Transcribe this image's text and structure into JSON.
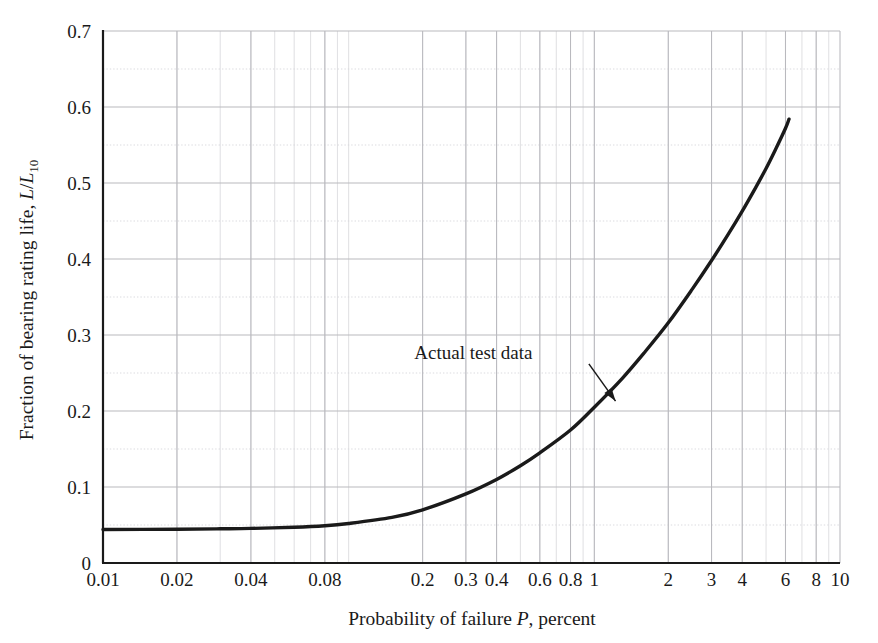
{
  "figure": {
    "background_color": "#ffffff",
    "frame_color": "#1a1a1a",
    "grid_major_color": "#b9b9be",
    "grid_minor_color": "#d7d7db",
    "curve_color": "#1a1a1a"
  },
  "chart_data": {
    "type": "line",
    "title": "",
    "xlabel_parts": {
      "before": "Probability of failure ",
      "italic": "P",
      "after": ", percent"
    },
    "xlabel": "Probability of failure P, percent",
    "ylabel_parts": {
      "before": "Fraction of bearing rating life, ",
      "italic_1": "L",
      "slash": "/",
      "italic_2": "L",
      "subscript": "10"
    },
    "ylabel": "Fraction of bearing rating life, L/L10",
    "xscale": "log",
    "yscale": "linear",
    "xlim": [
      0.01,
      10
    ],
    "ylim": [
      0,
      0.7
    ],
    "grid": true,
    "legend": "none",
    "xticks": [
      0.01,
      0.02,
      0.04,
      0.08,
      0.2,
      0.3,
      0.4,
      0.6,
      0.8,
      1,
      2,
      3,
      4,
      6,
      8,
      10
    ],
    "xtick_labels": [
      "0.01",
      "0.02",
      "0.04",
      "0.08",
      "0.2",
      "0.3",
      "0.4",
      "0.6",
      "0.8",
      "1",
      "2",
      "3",
      "4",
      "6",
      "8",
      "10"
    ],
    "yticks": [
      0,
      0.1,
      0.2,
      0.3,
      0.4,
      0.5,
      0.6,
      0.7
    ],
    "ytick_labels": [
      "0",
      "0.1",
      "0.2",
      "0.3",
      "0.4",
      "0.5",
      "0.6",
      "0.7"
    ],
    "y_minor_ticks": [
      0.05,
      0.15,
      0.25,
      0.35,
      0.45,
      0.55,
      0.65
    ],
    "series": [
      {
        "name": "Actual test data",
        "x": [
          0.01,
          0.02,
          0.03,
          0.04,
          0.06,
          0.08,
          0.1,
          0.15,
          0.2,
          0.3,
          0.4,
          0.5,
          0.6,
          0.8,
          1.0,
          1.3,
          1.6,
          2.0,
          2.5,
          3.0,
          3.5,
          4.0,
          4.5,
          5.0,
          5.5,
          6.0,
          6.2
        ],
        "y": [
          0.044,
          0.0445,
          0.045,
          0.0455,
          0.047,
          0.049,
          0.052,
          0.06,
          0.07,
          0.091,
          0.11,
          0.128,
          0.145,
          0.175,
          0.205,
          0.243,
          0.277,
          0.316,
          0.36,
          0.398,
          0.432,
          0.463,
          0.492,
          0.519,
          0.546,
          0.572,
          0.584
        ]
      }
    ],
    "annotations": [
      {
        "text": "Actual test data",
        "text_x": 0.56,
        "text_y": 0.268,
        "arrow_from_x": 0.95,
        "arrow_from_y": 0.262,
        "arrow_to_x": 1.22,
        "arrow_to_y": 0.213
      }
    ]
  }
}
